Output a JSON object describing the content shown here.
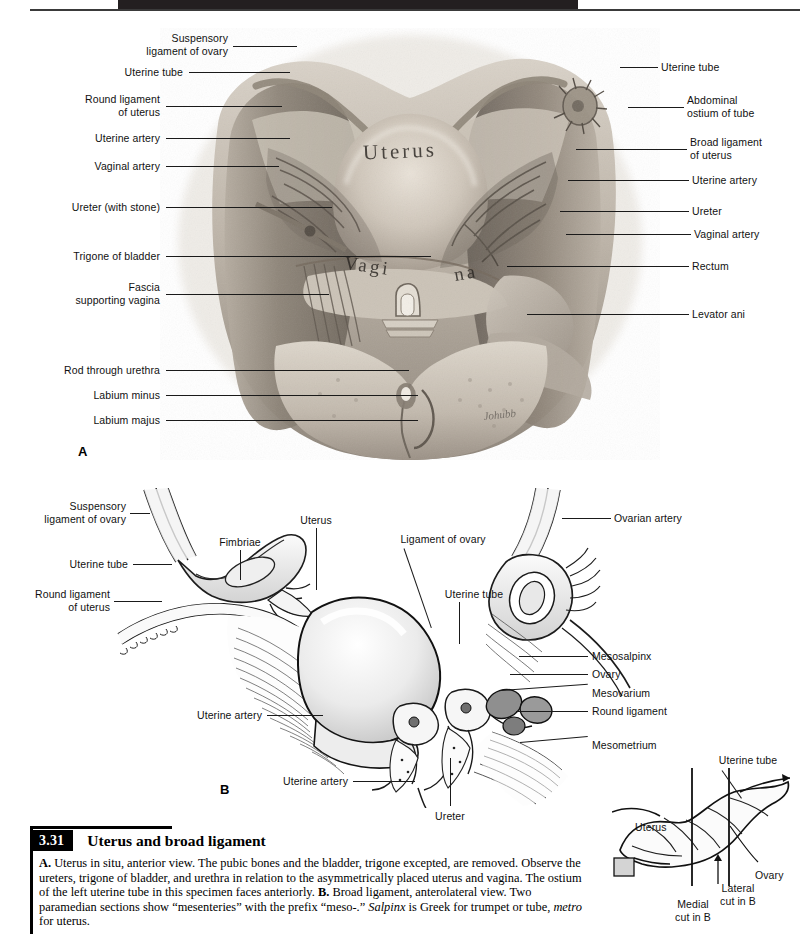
{
  "page": {
    "background_color": "#ffffff",
    "header_band_color": "#231f20",
    "ink_color": "#111111"
  },
  "figure_a": {
    "panel_letter": "A",
    "specimen_words": [
      {
        "text": "Uterus"
      },
      {
        "text": "Vagi"
      },
      {
        "text": "na"
      }
    ],
    "signature": "Johubb",
    "labels_left": [
      {
        "text": "Suspensory\nligament of ovary"
      },
      {
        "text": "Uterine tube"
      },
      {
        "text": "Round ligament\nof uterus"
      },
      {
        "text": "Uterine artery"
      },
      {
        "text": "Vaginal artery"
      },
      {
        "text": "Ureter (with stone)"
      },
      {
        "text": "Trigone of bladder"
      },
      {
        "text": "Fascia\nsupporting vagina"
      },
      {
        "text": "Rod through urethra"
      },
      {
        "text": "Labium minus"
      },
      {
        "text": "Labium majus"
      }
    ],
    "labels_right": [
      {
        "text": "Uterine tube"
      },
      {
        "text": "Abdominal\nostium of tube"
      },
      {
        "text": "Broad ligament\nof uterus"
      },
      {
        "text": "Uterine artery"
      },
      {
        "text": "Ureter"
      },
      {
        "text": "Vaginal artery"
      },
      {
        "text": "Rectum"
      },
      {
        "text": "Levator ani"
      }
    ]
  },
  "figure_b": {
    "panel_letter": "B",
    "labels_left": [
      {
        "text": "Suspensory\nligament of ovary"
      },
      {
        "text": "Uterine tube"
      },
      {
        "text": "Round ligament\nof uterus"
      },
      {
        "text": "Uterine artery"
      },
      {
        "text": "Uterine artery"
      }
    ],
    "labels_top": [
      {
        "text": "Fimbriae"
      },
      {
        "text": "Uterus"
      },
      {
        "text": "Ligament of ovary"
      },
      {
        "text": "Uterine tube"
      },
      {
        "text": "Ovarian artery"
      }
    ],
    "labels_right": [
      {
        "text": "Mesosalpinx"
      },
      {
        "text": "Ovary"
      },
      {
        "text": "Mesovarium"
      },
      {
        "text": "Round ligament"
      },
      {
        "text": "Mesometrium"
      }
    ],
    "labels_bottom": [
      {
        "text": "Ureter"
      }
    ]
  },
  "figure_inset": {
    "labels": [
      {
        "text": "Uterine tube"
      },
      {
        "text": "Uterus"
      },
      {
        "text": "Ovary"
      },
      {
        "text": "Medial\ncut in B"
      },
      {
        "text": "Lateral\ncut in B"
      }
    ]
  },
  "caption": {
    "figure_number": "3.31",
    "title": "Uterus and broad ligament",
    "body_runs": [
      {
        "text": "A.",
        "style": "bold"
      },
      {
        "text": " Uterus in situ, anterior view. The pubic bones and the bladder, trigone excepted, are removed. Observe the ureters, trigone of bladder, and urethra in relation to the asymmetrically placed uterus and vagina. The ostium of the left uterine tube in this specimen faces anteriorly. ",
        "style": "normal"
      },
      {
        "text": "B.",
        "style": "bold"
      },
      {
        "text": " Broad ligament, anterolateral view. Two paramedian sections show “mesenteries” with the prefix “meso-.” ",
        "style": "normal"
      },
      {
        "text": "Salpinx",
        "style": "italic"
      },
      {
        "text": " is Greek for trumpet or tube, ",
        "style": "normal"
      },
      {
        "text": "metro",
        "style": "italic"
      },
      {
        "text": " for uterus.",
        "style": "normal"
      }
    ]
  }
}
